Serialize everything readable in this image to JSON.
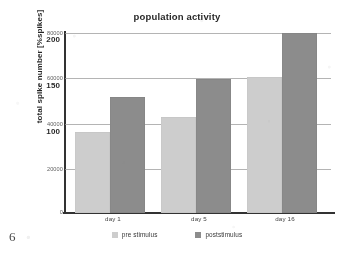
{
  "page": {
    "number": "6"
  },
  "chart_data": {
    "type": "bar",
    "title": "population activity",
    "xlabel": "",
    "ylabel": "total spike number [%spikes]",
    "categories": [
      "day 1",
      "day 5",
      "day 16"
    ],
    "series": [
      {
        "name": "pre stimulus",
        "color": "#cfcfcf",
        "values": [
          36000,
          42500,
          60500
        ]
      },
      {
        "name": "poststimulus",
        "color": "#8a8a8a",
        "values": [
          51500,
          59500,
          80000
        ]
      }
    ],
    "ylim": [
      0,
      80000
    ],
    "y_axis_primary": {
      "name": "total spike number",
      "ticks": [
        "80000",
        "60000",
        "40000",
        "20000",
        "0"
      ],
      "tick_values": [
        80000,
        60000,
        40000,
        20000,
        0
      ]
    },
    "y_axis_secondary": {
      "name": "%spikes",
      "ticks": [
        "200",
        "150",
        "100"
      ],
      "tick_values": [
        200,
        150,
        100
      ]
    },
    "grid": true,
    "legend_position": "bottom"
  },
  "legend": {
    "items": [
      {
        "label": "pre stimulus"
      },
      {
        "label": "poststimulus"
      }
    ]
  }
}
